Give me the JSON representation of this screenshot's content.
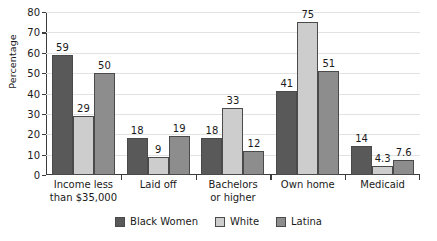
{
  "chart_data": {
    "type": "bar",
    "title": "",
    "xlabel": "",
    "ylabel": "Percentage",
    "ylim": [
      0,
      80
    ],
    "ytick_step": 10,
    "yticks": [
      0,
      10,
      20,
      30,
      40,
      50,
      60,
      70,
      80
    ],
    "grid": true,
    "legend_position": "bottom",
    "categories": [
      "Income less\nthan $35,000",
      "Laid off",
      "Bachelors\nor higher",
      "Own home",
      "Medicaid"
    ],
    "category_lines": [
      [
        "Income less",
        "than $35,000"
      ],
      [
        "Laid off",
        ""
      ],
      [
        "Bachelors",
        "or higher"
      ],
      [
        "Own home",
        ""
      ],
      [
        "Medicaid",
        ""
      ]
    ],
    "series": [
      {
        "name": "Black Women",
        "color": "#595959",
        "values": [
          59,
          18,
          18,
          41,
          14
        ],
        "labels": [
          "59",
          "18",
          "18",
          "41",
          "14"
        ]
      },
      {
        "name": "White",
        "color": "#cdcdcd",
        "values": [
          29,
          9,
          33,
          75,
          4.3
        ],
        "labels": [
          "29",
          "9",
          "33",
          "75",
          "4.3"
        ]
      },
      {
        "name": "Latina",
        "color": "#8d8d8d",
        "values": [
          50,
          19,
          12,
          51,
          7.6
        ],
        "labels": [
          "50",
          "19",
          "12",
          "51",
          "7.6"
        ]
      }
    ]
  },
  "axis": {
    "y_title": "Percentage",
    "tick_labels": [
      "80",
      "70",
      "60",
      "50",
      "40",
      "30",
      "20",
      "10",
      "0"
    ]
  },
  "legend": {
    "items": [
      {
        "label": "Black Women",
        "color": "#595959"
      },
      {
        "label": "White",
        "color": "#cdcdcd"
      },
      {
        "label": "Latina",
        "color": "#8d8d8d"
      }
    ]
  },
  "colors": {
    "black_women": "#595959",
    "white": "#cdcdcd",
    "latina": "#8d8d8d",
    "axis": "#3b3b3b",
    "grid": "#e2e2e2",
    "text": "#1a1a1a",
    "background": "#ffffff"
  }
}
